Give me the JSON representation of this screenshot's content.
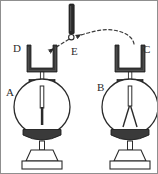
{
  "figure": {
    "background_color": "#ffffff",
    "ink_color": "#2b2b2b",
    "metal_color": "#3a3a3a",
    "border_color": "#8f8f8f"
  },
  "labels": [
    {
      "id": "label-d",
      "text": "D",
      "x": 12,
      "y": 51,
      "desc": "U-bracket on left electroscope"
    },
    {
      "id": "label-e",
      "text": "E",
      "x": 70,
      "y": 54,
      "desc": "sphere at tip of charged rod"
    },
    {
      "id": "label-c",
      "text": "C",
      "x": 142,
      "y": 52,
      "desc": "U-bracket on right electroscope"
    },
    {
      "id": "label-a",
      "text": "A",
      "x": 5,
      "y": 95,
      "desc": "left electroscope, leaves closed"
    },
    {
      "id": "label-b",
      "text": "B",
      "x": 96,
      "y": 90,
      "desc": "right electroscope, leaves diverged"
    }
  ],
  "rod": {
    "name": "charged-rod",
    "x": 68,
    "y_top": 3,
    "y_bottom": 32,
    "width": 5,
    "color": "#2b2b2b",
    "tip_sphere": {
      "cx": 70,
      "cy": 36,
      "r": 2.6,
      "fill": "#ffffff",
      "stroke": "#2b2b2b"
    }
  },
  "motion_path": {
    "name": "dashed-motion-arc",
    "style": "dashed",
    "from": "C",
    "to": "D",
    "via": "E",
    "dash": "3 3",
    "color": "#3a3a3a",
    "arrowheads": 2
  },
  "electroscopes": [
    {
      "id": "electroscope-left",
      "label": "A",
      "bracket_label": "D",
      "bracket_x": 26,
      "bulb_cx": 41,
      "bulb_cy": 106,
      "bulb_r": 28,
      "leaves_state": "closed",
      "leaf_spread_deg": 0
    },
    {
      "id": "electroscope-right",
      "label": "B",
      "bracket_label": "C",
      "bracket_x": 114,
      "bulb_cx": 129,
      "bulb_cy": 106,
      "bulb_r": 28,
      "leaves_state": "diverged",
      "leaf_spread_deg": 24
    }
  ]
}
